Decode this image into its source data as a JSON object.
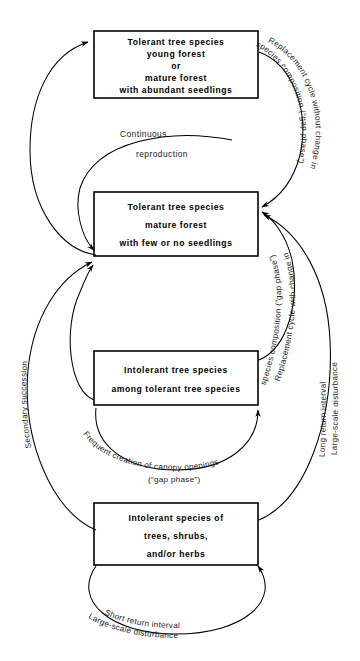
{
  "diagram": {
    "type": "forest-succession-cycle-diagram",
    "boxes": [
      {
        "id": "box-tolerant-young",
        "lines": [
          "Tolerant tree species",
          "young forest",
          "or",
          "mature forest",
          "with abundant seedlings"
        ]
      },
      {
        "id": "box-tolerant-mature",
        "lines": [
          "Tolerant tree species",
          "mature forest",
          "with few or no seedlings"
        ]
      },
      {
        "id": "box-intolerant-among-tolerant",
        "lines": [
          "Intolerant tree species",
          "among tolerant tree species"
        ]
      },
      {
        "id": "box-intolerant-species",
        "lines": [
          "Intolerant species of",
          "trees, shrubs,",
          "and/or herbs"
        ]
      }
    ],
    "labels": {
      "continuous_reproduction": {
        "line1": "Continuous",
        "line2": "reproduction"
      },
      "replacement_no_change": {
        "line1": "Replacement cycle without change in",
        "line2": "species composition (“gap phase”)"
      },
      "replacement_with_change": {
        "line1": "Replacement cycle with change in",
        "line2": "species composition (“gap phase”)"
      },
      "large_scale_long": {
        "line1": "Large-scale disturbance",
        "line2": "Long return interval"
      },
      "secondary_succession": {
        "line1": "Secondary succession"
      },
      "frequent_creation": {
        "line1": "Frequent creation of canopy openings",
        "line2": "(“gap phase”)"
      },
      "short_return": {
        "line1": "Short return interval",
        "line2": "Large-scale disturbance"
      }
    },
    "colors": {
      "stroke": "#000000",
      "background": "#ffffff",
      "text": "#000000"
    }
  }
}
